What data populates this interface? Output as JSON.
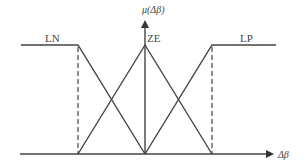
{
  "diagram": {
    "type": "fuzzy membership functions",
    "y_axis_label": "μ(Δβ)",
    "x_axis_label": "Δβ",
    "sets": [
      {
        "name": "LN",
        "shape": "left shoulder (Z-shaped)"
      },
      {
        "name": "ZE",
        "shape": "triangle"
      },
      {
        "name": "LP",
        "shape": "right shoulder (S-shaped)"
      }
    ],
    "line_color": "#444444"
  },
  "labels": {
    "ln": "LN",
    "ze": "ZE",
    "lp": "LP",
    "mu": "μ(Δβ)",
    "dbeta": "Δβ"
  }
}
